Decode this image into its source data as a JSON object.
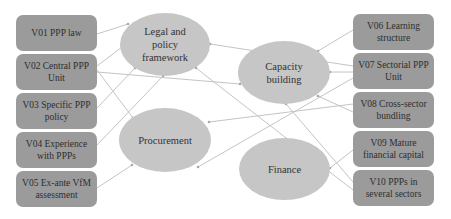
{
  "colors": {
    "variable_box": "#9b9b9b",
    "factor_ellipse": "#c6c6c6",
    "connector": "#c4c4c4",
    "text": "#2e2e2e"
  },
  "variables_left": [
    {
      "id": "V01",
      "label": "V01 PPP law"
    },
    {
      "id": "V02",
      "label": "V02 Central PPP Unit"
    },
    {
      "id": "V03",
      "label": "V03 Specific PPP policy"
    },
    {
      "id": "V04",
      "label": "V04 Experience with PPPs"
    },
    {
      "id": "V05",
      "label": "V05 Ex-ante VfM assessment"
    }
  ],
  "variables_right": [
    {
      "id": "V06",
      "label": "V06 Learning structure"
    },
    {
      "id": "V07",
      "label": "V07 Sectorial PPP Unit"
    },
    {
      "id": "V08",
      "label": "V08 Cross-sector bundling"
    },
    {
      "id": "V09",
      "label": "V09 Mature financial capital"
    },
    {
      "id": "V10",
      "label": "V10 PPPs in several sectors"
    }
  ],
  "factors": [
    {
      "id": "legal",
      "label": "Legal and policy framework"
    },
    {
      "id": "capacity",
      "label": "Capacity building"
    },
    {
      "id": "procurement",
      "label": "Procurement"
    },
    {
      "id": "finance",
      "label": "Finance"
    }
  ],
  "connections": [
    {
      "from": "V01",
      "to": "legal"
    },
    {
      "from": "V02",
      "to": "legal"
    },
    {
      "from": "V02",
      "to": "capacity"
    },
    {
      "from": "V02",
      "to": "procurement"
    },
    {
      "from": "V03",
      "to": "legal"
    },
    {
      "from": "V04",
      "to": "legal"
    },
    {
      "from": "V05",
      "to": "procurement"
    },
    {
      "from": "V06",
      "to": "capacity"
    },
    {
      "from": "V07",
      "to": "capacity"
    },
    {
      "from": "V07",
      "to": "legal"
    },
    {
      "from": "V07",
      "to": "procurement"
    },
    {
      "from": "V08",
      "to": "capacity"
    },
    {
      "from": "V08",
      "to": "procurement"
    },
    {
      "from": "V09",
      "to": "finance"
    },
    {
      "from": "V10",
      "to": "legal"
    },
    {
      "from": "V10",
      "to": "capacity"
    }
  ]
}
